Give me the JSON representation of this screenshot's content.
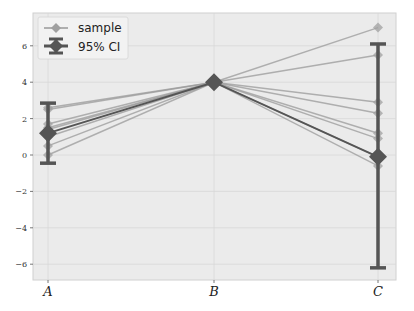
{
  "chart_data": {
    "type": "line",
    "title": "",
    "xlabel": "",
    "ylabel": "",
    "categories": [
      "A",
      "B",
      "C"
    ],
    "ylim": [
      -6.9,
      7.5
    ],
    "yticks": [
      -6,
      -4,
      -2,
      0,
      2,
      4,
      6
    ],
    "grid": true,
    "legend_position": "upper left",
    "legend": [
      "sample",
      "95% CI"
    ],
    "series": [
      {
        "name": "sample 1",
        "values": [
          2.5,
          4.0,
          7.0
        ]
      },
      {
        "name": "sample 2",
        "values": [
          1.7,
          4.0,
          5.5
        ]
      },
      {
        "name": "sample 3",
        "values": [
          2.6,
          4.0,
          2.9
        ]
      },
      {
        "name": "sample 4",
        "values": [
          1.4,
          4.0,
          2.3
        ]
      },
      {
        "name": "sample 5",
        "values": [
          0.5,
          4.0,
          1.2
        ]
      },
      {
        "name": "sample 6",
        "values": [
          0.0,
          4.0,
          0.9
        ]
      },
      {
        "name": "sample 7",
        "values": [
          1.0,
          4.0,
          -0.6
        ]
      },
      {
        "name": "sample 8",
        "values": [
          1.5,
          4.0,
          -0.1
        ]
      }
    ],
    "mean": {
      "name": "95% CI",
      "values": [
        1.2,
        4.0,
        -0.1
      ]
    },
    "ci": [
      {
        "category": "A",
        "low": -0.45,
        "high": 2.85
      },
      {
        "category": "B",
        "low": 4.0,
        "high": 4.0
      },
      {
        "category": "C",
        "low": -6.2,
        "high": 6.1
      }
    ],
    "colors": {
      "sample": "#999999",
      "sample_marker": "#a0a0a0",
      "mean": "#555555",
      "plot_bg": "#ebebeb",
      "grid": "#d8d8d8"
    }
  },
  "legend": {
    "sample_label": "sample",
    "ci_label": "95% CI"
  },
  "axes": {
    "x_labels": [
      "A",
      "B",
      "C"
    ],
    "y_labels": [
      "6",
      "4",
      "2",
      "0",
      "−2",
      "−4",
      "−6"
    ]
  }
}
